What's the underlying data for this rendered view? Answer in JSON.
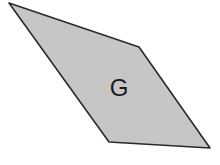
{
  "diagram": {
    "shape": "parallelogram",
    "label": "G",
    "vertices": [
      [
        9,
        3
      ],
      [
        139,
        47
      ],
      [
        210,
        148
      ],
      [
        109,
        142
      ]
    ],
    "fill_color": "#c6c6c6",
    "stroke_color": "#2a2a2a",
    "label_position": [
      119,
      96
    ]
  }
}
